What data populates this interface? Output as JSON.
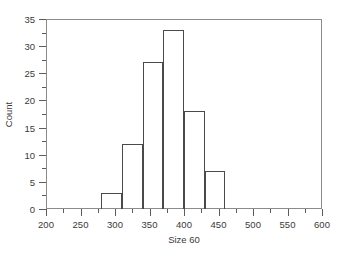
{
  "chart_data": {
    "type": "bar",
    "title": "",
    "subtitle": "",
    "xlabel": "Size 60",
    "ylabel": "Count",
    "xlim": [
      200,
      600
    ],
    "ylim": [
      0,
      35
    ],
    "grid": false,
    "legend": null,
    "bin_edges": [
      280,
      310,
      340,
      370,
      400,
      430,
      460
    ],
    "bin_width": 30,
    "categories": [
      "280-310",
      "310-340",
      "340-370",
      "370-400",
      "400-430",
      "430-460"
    ],
    "values": [
      3,
      12,
      27,
      33,
      18,
      7
    ],
    "bars": [
      {
        "x0": 280,
        "x1": 310,
        "value": 3
      },
      {
        "x0": 310,
        "x1": 340,
        "value": 12
      },
      {
        "x0": 340,
        "x1": 370,
        "value": 27
      },
      {
        "x0": 370,
        "x1": 400,
        "value": 33
      },
      {
        "x0": 400,
        "x1": 430,
        "value": 18
      },
      {
        "x0": 430,
        "x1": 460,
        "value": 7
      }
    ],
    "x_major_ticks": [
      200,
      250,
      300,
      350,
      400,
      450,
      500,
      550,
      600
    ],
    "x_tick_labels": [
      "200",
      "250",
      "300",
      "350",
      "400",
      "450",
      "500",
      "550",
      "600"
    ],
    "x_minor_ticks": [
      225,
      275,
      325,
      375,
      425,
      475,
      525,
      575
    ],
    "y_major_ticks": [
      0,
      5,
      10,
      15,
      20,
      25,
      30,
      35
    ],
    "y_tick_labels": [
      "0",
      "5",
      "10",
      "15",
      "20",
      "25",
      "30",
      "35"
    ],
    "y_minor_ticks": [
      2.5,
      7.5,
      12.5,
      17.5,
      22.5,
      27.5,
      32.5
    ],
    "colors": {
      "bar_outline": "#4a4a4a",
      "bar_fill": "transparent",
      "axis": "#8b8b8b",
      "tick": "#5c5c5c",
      "text": "#3a3a3a",
      "background": "#ffffff"
    }
  }
}
